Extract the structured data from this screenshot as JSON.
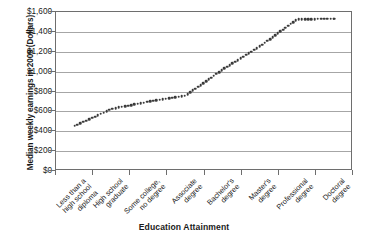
{
  "chart_data": {
    "type": "line",
    "title": "",
    "xlabel": "Education Attainment",
    "ylabel": "Median weekly earnings in 2009 (Dollars)",
    "categories": [
      "Less than a high school diploma",
      "High school graduate",
      "Some college, no degree",
      "Associate degree",
      "Bachelor's degree",
      "Master's degree",
      "Professional degree",
      "Doctoral degree"
    ],
    "category_lines": [
      "Less than a\nhigh school\ndiploma",
      "High school\ngraduate",
      "Some college,\nno degree",
      "Associate\ndegree",
      "Bachelor's\ndegree",
      "Master's\ndegree",
      "Professional\ndegree",
      "Doctoral\ndegree"
    ],
    "values": [
      454,
      626,
      699,
      761,
      1025,
      1257,
      1529,
      1532
    ],
    "ylim": [
      0,
      1600
    ],
    "ytick_values": [
      0,
      200,
      400,
      600,
      800,
      1000,
      1200,
      1400,
      1600
    ],
    "ytick_labels": [
      "$0",
      "$200",
      "$400",
      "$600",
      "$800",
      "$1,000",
      "$1,200",
      "$1,400",
      "$1,600"
    ],
    "grid": true,
    "legend": "none",
    "marker": "dotted",
    "series_color": "#3a3a3a",
    "gridline_color": "#a6a6a6",
    "axis_color": "#6e6e6e"
  }
}
